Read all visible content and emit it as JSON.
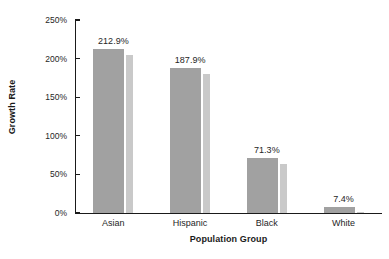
{
  "chart_data": {
    "type": "bar",
    "title": "",
    "xlabel": "Population Group",
    "ylabel": "Growth Rate",
    "categories": [
      "Asian",
      "Hispanic",
      "Black",
      "White"
    ],
    "values": [
      212.9,
      187.9,
      71.3,
      7.4
    ],
    "value_labels": [
      "212.9%",
      "187.9%",
      "71.3%",
      "7.4%"
    ],
    "ylim": [
      0,
      250
    ],
    "yticks": [
      0,
      50,
      100,
      150,
      200,
      250
    ],
    "ytick_labels": [
      "0%",
      "50%",
      "100%",
      "150%",
      "200%",
      "250%"
    ],
    "grid": false,
    "legend": "none",
    "series": [
      {
        "name": "Growth Rate",
        "values": [
          212.9,
          187.9,
          71.3,
          7.4
        ]
      }
    ],
    "colors": {
      "bar": "#a1a1a1",
      "bar_shadow": "#c9c9c9",
      "axis": "#1a1a1a",
      "text": "#262626",
      "background": "#ffffff"
    }
  }
}
